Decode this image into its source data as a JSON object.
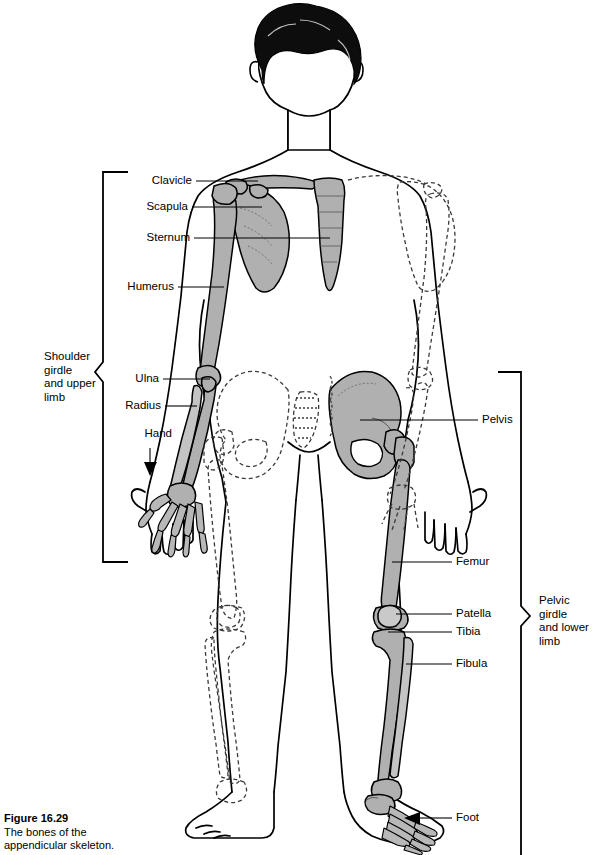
{
  "figure": {
    "number": "Figure 16.29",
    "caption_line1": "The bones of the",
    "caption_line2": "appendicular skeleton."
  },
  "diagram": {
    "type": "anatomical-illustration",
    "colors": {
      "bone_fill": "#b0b0b0",
      "bone_fill_light": "#c4c4c4",
      "outline": "#000000",
      "hair": "#0d0d0d",
      "background": "#ffffff",
      "dashed_bone": "#444444"
    },
    "notes": {
      "solid_side": "viewer-left arm / viewer-right leg shaded gray (appendicular bones shown)",
      "dashed_side": "opposite limbs drawn as dashed outlines"
    }
  },
  "labels": {
    "left": [
      {
        "id": "clavicle",
        "text": "Clavicle"
      },
      {
        "id": "scapula",
        "text": "Scapula"
      },
      {
        "id": "sternum",
        "text": "Sternum"
      },
      {
        "id": "humerus",
        "text": "Humerus"
      },
      {
        "id": "ulna",
        "text": "Ulna"
      },
      {
        "id": "radius",
        "text": "Radius"
      },
      {
        "id": "hand",
        "text": "Hand"
      }
    ],
    "right": [
      {
        "id": "pelvis",
        "text": "Pelvis"
      },
      {
        "id": "femur",
        "text": "Femur"
      },
      {
        "id": "patella",
        "text": "Patella"
      },
      {
        "id": "tibia",
        "text": "Tibia"
      },
      {
        "id": "fibula",
        "text": "Fibula"
      },
      {
        "id": "foot",
        "text": "Foot"
      }
    ]
  },
  "groups": {
    "shoulder": {
      "line1": "Shoulder",
      "line2": "girdle",
      "line3": "and upper",
      "line4": "limb"
    },
    "pelvic": {
      "line1": "Pelvic",
      "line2": "girdle",
      "line3": "and lower",
      "line4": "limb"
    }
  }
}
